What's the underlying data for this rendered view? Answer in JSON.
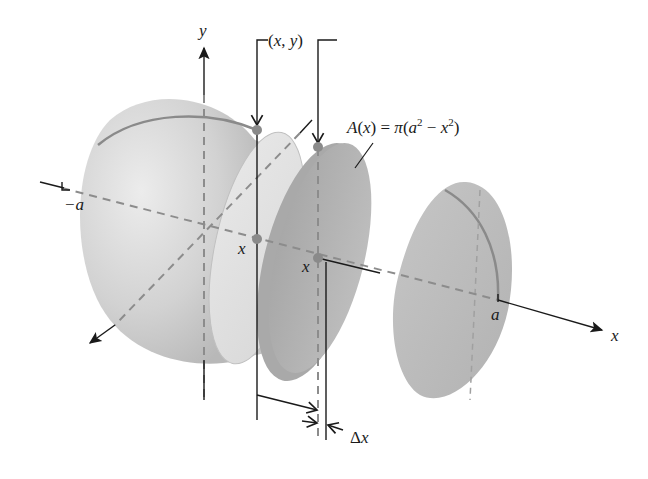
{
  "diagram": {
    "labels": {
      "y_axis": "y",
      "x_axis": "x",
      "z_axis_arrow": "",
      "point_xy": "(x, y)",
      "area_formula_lhs": "A(x)",
      "area_formula": "A(x) = π(a² − x²)",
      "neg_a": "−a",
      "pos_a": "a",
      "x_mark_1": "x",
      "x_mark_2": "x",
      "delta_x": "Δx"
    },
    "colors": {
      "sphere_fill": "#c8c8c8",
      "sphere_light": "#e6e6e6",
      "slice_fill": "#b4b4b4",
      "cut_face": "#dcdcdc",
      "outline_arc": "#8a8a8a",
      "dashed_axis": "#8c8c8c",
      "point_marker": "#8a8a8a",
      "ink": "#1a1a1a"
    }
  }
}
